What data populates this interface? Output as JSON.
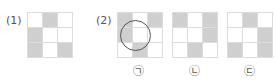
{
  "problem": {
    "part1": {
      "label": "(1)",
      "grid": [
        [
          0,
          1,
          0
        ],
        [
          1,
          0,
          0
        ],
        [
          1,
          0,
          1
        ]
      ]
    },
    "part2": {
      "label": "(2)",
      "options": [
        {
          "label": "㉠",
          "grid": [
            [
              1,
              0,
              1
            ],
            [
              1,
              0,
              0
            ],
            [
              0,
              1,
              0
            ]
          ],
          "circled": true
        },
        {
          "label": "㉡",
          "grid": [
            [
              1,
              0,
              1
            ],
            [
              0,
              0,
              1
            ],
            [
              0,
              1,
              0
            ]
          ],
          "circled": false
        },
        {
          "label": "㉢",
          "grid": [
            [
              0,
              1,
              0
            ],
            [
              0,
              0,
              1
            ],
            [
              1,
              0,
              1
            ]
          ],
          "circled": false
        }
      ]
    }
  },
  "colors": {
    "filled": "#cfcfcf",
    "empty": "#ffffff",
    "gridline": "#dcdcdc",
    "circle": "#555555"
  }
}
